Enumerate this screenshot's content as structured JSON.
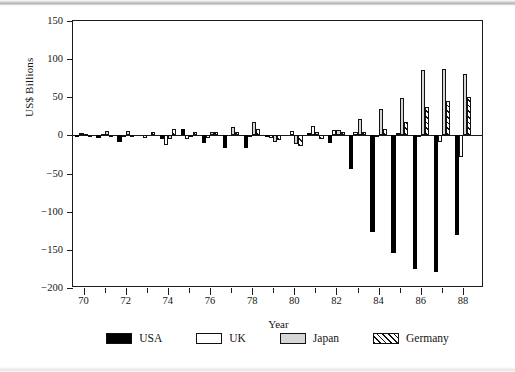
{
  "chart_data": {
    "type": "bar",
    "title": "",
    "xlabel": "Year",
    "ylabel": "US$ Billions",
    "ylim": [
      -200,
      150
    ],
    "yticks": [
      150,
      100,
      50,
      0,
      -50,
      -100,
      -150,
      -200
    ],
    "ytick_labels": [
      "150",
      "100",
      "50",
      "0",
      "−50",
      "−100",
      "−150",
      "−200"
    ],
    "xlim": [
      69.5,
      89.0
    ],
    "categories": [
      "70",
      "71",
      "72",
      "73",
      "74",
      "75",
      "76",
      "77",
      "78",
      "79",
      "80",
      "81",
      "82",
      "83",
      "84",
      "85",
      "86",
      "87",
      "88"
    ],
    "xtick_labels": [
      "70",
      "72",
      "74",
      "76",
      "78",
      "80",
      "82",
      "84",
      "86",
      "88"
    ],
    "grid": false,
    "legend_position": "bottom",
    "series": [
      {
        "name": "USA",
        "color": "#000000",
        "fill": "solid-black",
        "values": [
          -1,
          -4,
          -8,
          0,
          -5,
          8,
          -10,
          -16,
          -17,
          -2,
          0,
          3,
          -10,
          -44,
          -127,
          -154,
          -175,
          -179,
          -130
        ]
      },
      {
        "name": "UK",
        "color": "#ffffff",
        "fill": "white",
        "values": [
          3,
          2,
          -1,
          -3,
          -13,
          -5,
          -4,
          0,
          1,
          -4,
          6,
          12,
          7,
          4,
          1,
          3,
          -1,
          -8,
          -28
        ]
      },
      {
        "name": "Japan",
        "color": "#d6d6d6",
        "fill": "light-gray",
        "values": [
          2,
          6,
          6,
          0,
          -5,
          -1,
          4,
          11,
          17,
          -9,
          -11,
          5,
          7,
          21,
          35,
          49,
          86,
          87,
          80
        ]
      },
      {
        "name": "Germany",
        "color": "#ffffff",
        "fill": "diagonal-hatch",
        "values": [
          1,
          1,
          1,
          4,
          9,
          4,
          4,
          4,
          9,
          -6,
          -14,
          -5,
          4,
          4,
          9,
          17,
          37,
          45,
          50
        ]
      }
    ]
  },
  "legend": {
    "items": [
      {
        "label": "USA",
        "swatch": "solid-black"
      },
      {
        "label": "UK",
        "swatch": "white"
      },
      {
        "label": "Japan",
        "swatch": "light-gray"
      },
      {
        "label": "Germany",
        "swatch": "diagonal-hatch"
      }
    ]
  }
}
